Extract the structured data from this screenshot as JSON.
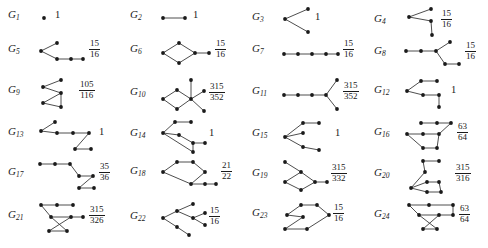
{
  "figure": {
    "type": "graph-catalog",
    "columns": 4,
    "rows": 6,
    "count": 24,
    "node_color": "#1a1a1a",
    "edge_color": "#3a3a3a"
  },
  "graphs": [
    {
      "id": "G1",
      "label": "G",
      "index": "1",
      "value": "1",
      "value_kind": "integer",
      "numerator": "1",
      "denominator": "",
      "width": 14,
      "height": 26,
      "nodes": [
        [
          7,
          13
        ]
      ],
      "edges": []
    },
    {
      "id": "G2",
      "label": "G",
      "index": "2",
      "value": "1",
      "value_kind": "integer",
      "numerator": "1",
      "denominator": "",
      "width": 30,
      "height": 26,
      "nodes": [
        [
          4,
          13
        ],
        [
          26,
          13
        ]
      ],
      "edges": [
        [
          0,
          1
        ]
      ]
    },
    {
      "id": "G3",
      "label": "G",
      "index": "3",
      "value": "1",
      "value_kind": "integer",
      "numerator": "1",
      "denominator": "",
      "width": 30,
      "height": 30,
      "nodes": [
        [
          27,
          4
        ],
        [
          4,
          14
        ],
        [
          27,
          27
        ]
      ],
      "edges": [
        [
          0,
          1
        ],
        [
          1,
          2
        ]
      ]
    },
    {
      "id": "G4",
      "label": "G",
      "index": "4",
      "value_kind": "fraction",
      "numerator": "15",
      "denominator": "16",
      "width": 34,
      "height": 34,
      "nodes": [
        [
          28,
          4
        ],
        [
          6,
          12
        ],
        [
          28,
          16
        ],
        [
          29,
          30
        ]
      ],
      "edges": [
        [
          0,
          1
        ],
        [
          1,
          2
        ],
        [
          2,
          3
        ]
      ]
    },
    {
      "id": "G5",
      "label": "G",
      "index": "5",
      "value_kind": "fraction",
      "numerator": "15",
      "denominator": "16",
      "width": 48,
      "height": 26,
      "nodes": [
        [
          20,
          4
        ],
        [
          4,
          12
        ],
        [
          20,
          20
        ],
        [
          34,
          20
        ],
        [
          46,
          20
        ]
      ],
      "edges": [
        [
          0,
          1
        ],
        [
          1,
          2
        ],
        [
          2,
          3
        ],
        [
          3,
          4
        ]
      ]
    },
    {
      "id": "G6",
      "label": "G",
      "index": "6",
      "value_kind": "fraction",
      "numerator": "15",
      "denominator": "16",
      "width": 52,
      "height": 26,
      "nodes": [
        [
          20,
          4
        ],
        [
          4,
          14
        ],
        [
          20,
          24
        ],
        [
          36,
          14
        ],
        [
          50,
          14
        ]
      ],
      "edges": [
        [
          0,
          1
        ],
        [
          1,
          2
        ],
        [
          2,
          3
        ],
        [
          3,
          0
        ],
        [
          3,
          4
        ]
      ]
    },
    {
      "id": "G7",
      "label": "G",
      "index": "7",
      "value_kind": "fraction",
      "numerator": "15",
      "denominator": "16",
      "width": 58,
      "height": 22,
      "nodes": [
        [
          3,
          13
        ],
        [
          17,
          13
        ],
        [
          31,
          13
        ],
        [
          45,
          13
        ],
        [
          57,
          13
        ]
      ],
      "edges": [
        [
          0,
          1
        ],
        [
          1,
          2
        ],
        [
          2,
          3
        ],
        [
          3,
          4
        ]
      ]
    },
    {
      "id": "G8",
      "label": "G",
      "index": "8",
      "value_kind": "fraction",
      "numerator": "15",
      "denominator": "16",
      "width": 58,
      "height": 30,
      "nodes": [
        [
          3,
          12
        ],
        [
          18,
          12
        ],
        [
          33,
          12
        ],
        [
          47,
          3
        ],
        [
          42,
          25
        ],
        [
          56,
          25
        ]
      ],
      "edges": [
        [
          0,
          1
        ],
        [
          1,
          2
        ],
        [
          2,
          3
        ],
        [
          2,
          4
        ],
        [
          4,
          5
        ]
      ]
    },
    {
      "id": "G9",
      "label": "G",
      "index": "9",
      "value_kind": "fraction",
      "numerator": "105",
      "denominator": "116",
      "width": 38,
      "height": 32,
      "nodes": [
        [
          24,
          3
        ],
        [
          6,
          10
        ],
        [
          24,
          16
        ],
        [
          6,
          26
        ],
        [
          24,
          30
        ]
      ],
      "edges": [
        [
          0,
          1
        ],
        [
          1,
          2
        ],
        [
          2,
          3
        ],
        [
          2,
          4
        ],
        [
          3,
          4
        ]
      ]
    },
    {
      "id": "G10",
      "label": "G",
      "index": "10",
      "value_kind": "fraction",
      "numerator": "315",
      "denominator": "352",
      "width": 46,
      "height": 36,
      "nodes": [
        [
          32,
          3
        ],
        [
          18,
          13
        ],
        [
          4,
          22
        ],
        [
          18,
          32
        ],
        [
          32,
          22
        ],
        [
          45,
          14
        ],
        [
          45,
          34
        ]
      ],
      "edges": [
        [
          1,
          2
        ],
        [
          2,
          3
        ],
        [
          3,
          4
        ],
        [
          4,
          1
        ],
        [
          4,
          0
        ],
        [
          4,
          5
        ],
        [
          4,
          6
        ]
      ]
    },
    {
      "id": "G11",
      "label": "G",
      "index": "11",
      "value_kind": "fraction",
      "numerator": "315",
      "denominator": "352",
      "width": 58,
      "height": 34,
      "nodes": [
        [
          3,
          18
        ],
        [
          17,
          18
        ],
        [
          31,
          18
        ],
        [
          45,
          18
        ],
        [
          56,
          3
        ],
        [
          56,
          32
        ]
      ],
      "edges": [
        [
          0,
          1
        ],
        [
          1,
          2
        ],
        [
          2,
          3
        ],
        [
          3,
          4
        ],
        [
          3,
          5
        ]
      ]
    },
    {
      "id": "G12",
      "label": "G",
      "index": "12",
      "value": "1",
      "value_kind": "integer",
      "numerator": "1",
      "denominator": "",
      "width": 44,
      "height": 32,
      "nodes": [
        [
          18,
          4
        ],
        [
          34,
          4
        ],
        [
          4,
          14
        ],
        [
          20,
          18
        ],
        [
          36,
          18
        ],
        [
          36,
          30
        ]
      ],
      "edges": [
        [
          0,
          1
        ],
        [
          0,
          2
        ],
        [
          2,
          3
        ],
        [
          3,
          4
        ],
        [
          4,
          5
        ]
      ]
    },
    {
      "id": "G13",
      "label": "G",
      "index": "13",
      "value": "1",
      "value_kind": "integer",
      "numerator": "1",
      "denominator": "",
      "width": 58,
      "height": 32,
      "nodes": [
        [
          18,
          3
        ],
        [
          4,
          12
        ],
        [
          20,
          14
        ],
        [
          36,
          14
        ],
        [
          52,
          14
        ],
        [
          38,
          30
        ],
        [
          54,
          30
        ]
      ],
      "edges": [
        [
          0,
          1
        ],
        [
          1,
          2
        ],
        [
          2,
          3
        ],
        [
          3,
          4
        ],
        [
          4,
          5
        ],
        [
          5,
          6
        ]
      ]
    },
    {
      "id": "G14",
      "label": "G",
      "index": "14",
      "value": "1",
      "value_kind": "integer",
      "numerator": "1",
      "denominator": "",
      "width": 46,
      "height": 34,
      "nodes": [
        [
          16,
          3
        ],
        [
          32,
          3
        ],
        [
          4,
          14
        ],
        [
          20,
          16
        ],
        [
          34,
          24
        ],
        [
          46,
          24
        ],
        [
          34,
          33
        ]
      ],
      "edges": [
        [
          0,
          1
        ],
        [
          0,
          2
        ],
        [
          2,
          3
        ],
        [
          3,
          4
        ],
        [
          4,
          5
        ],
        [
          2,
          6
        ],
        [
          4,
          6
        ]
      ]
    },
    {
      "id": "G15",
      "label": "G",
      "index": "15",
      "value": "1",
      "value_kind": "integer",
      "numerator": "1",
      "denominator": "",
      "width": 50,
      "height": 34,
      "nodes": [
        [
          22,
          4
        ],
        [
          38,
          4
        ],
        [
          4,
          18
        ],
        [
          22,
          14
        ],
        [
          22,
          28
        ],
        [
          38,
          31
        ]
      ],
      "edges": [
        [
          0,
          1
        ],
        [
          0,
          2
        ],
        [
          2,
          3
        ],
        [
          2,
          4
        ],
        [
          4,
          5
        ]
      ]
    },
    {
      "id": "G16",
      "label": "G",
      "index": "16",
      "value_kind": "fraction",
      "numerator": "63",
      "denominator": "64",
      "width": 50,
      "height": 32,
      "nodes": [
        [
          18,
          4
        ],
        [
          34,
          4
        ],
        [
          48,
          4
        ],
        [
          4,
          15
        ],
        [
          20,
          15
        ],
        [
          36,
          15
        ],
        [
          20,
          29
        ],
        [
          34,
          29
        ]
      ],
      "edges": [
        [
          0,
          1
        ],
        [
          1,
          2
        ],
        [
          3,
          4
        ],
        [
          4,
          5
        ],
        [
          5,
          2
        ],
        [
          3,
          6
        ],
        [
          6,
          7
        ],
        [
          5,
          7
        ]
      ]
    },
    {
      "id": "G17",
      "label": "G",
      "index": "17",
      "value_kind": "fraction",
      "numerator": "35",
      "denominator": "36",
      "width": 58,
      "height": 34,
      "nodes": [
        [
          3,
          6
        ],
        [
          18,
          6
        ],
        [
          33,
          6
        ],
        [
          42,
          18
        ],
        [
          56,
          18
        ],
        [
          42,
          30
        ],
        [
          57,
          30
        ]
      ],
      "edges": [
        [
          0,
          1
        ],
        [
          1,
          2
        ],
        [
          2,
          3
        ],
        [
          3,
          4
        ],
        [
          4,
          5
        ],
        [
          5,
          6
        ]
      ]
    },
    {
      "id": "G18",
      "label": "G",
      "index": "18",
      "value_kind": "fraction",
      "numerator": "21",
      "denominator": "22",
      "width": 58,
      "height": 32,
      "nodes": [
        [
          18,
          4
        ],
        [
          34,
          4
        ],
        [
          4,
          14
        ],
        [
          46,
          14
        ],
        [
          32,
          26
        ],
        [
          46,
          26
        ],
        [
          57,
          26
        ]
      ],
      "edges": [
        [
          0,
          1
        ],
        [
          0,
          2
        ],
        [
          1,
          3
        ],
        [
          2,
          4
        ],
        [
          3,
          4
        ],
        [
          4,
          5
        ],
        [
          5,
          6
        ]
      ]
    },
    {
      "id": "G19",
      "label": "G",
      "index": "19",
      "value_kind": "fraction",
      "numerator": "315",
      "denominator": "332",
      "width": 46,
      "height": 36,
      "nodes": [
        [
          4,
          4
        ],
        [
          20,
          14
        ],
        [
          4,
          24
        ],
        [
          20,
          32
        ],
        [
          34,
          24
        ],
        [
          46,
          24
        ]
      ],
      "edges": [
        [
          0,
          1
        ],
        [
          1,
          2
        ],
        [
          2,
          3
        ],
        [
          3,
          4
        ],
        [
          1,
          4
        ],
        [
          4,
          5
        ]
      ]
    },
    {
      "id": "G20",
      "label": "G",
      "index": "20",
      "value_kind": "fraction",
      "numerator": "315",
      "denominator": "316",
      "width": 48,
      "height": 36,
      "nodes": [
        [
          20,
          3
        ],
        [
          36,
          3
        ],
        [
          22,
          14
        ],
        [
          8,
          30
        ],
        [
          24,
          24
        ],
        [
          24,
          34
        ],
        [
          38,
          34
        ],
        [
          36,
          24
        ]
      ],
      "edges": [
        [
          0,
          1
        ],
        [
          0,
          2
        ],
        [
          2,
          3
        ],
        [
          3,
          4
        ],
        [
          4,
          7
        ],
        [
          3,
          5
        ],
        [
          5,
          6
        ],
        [
          7,
          6
        ]
      ]
    },
    {
      "id": "G21",
      "label": "G",
      "index": "21",
      "value_kind": "fraction",
      "numerator": "315",
      "denominator": "326",
      "width": 48,
      "height": 34,
      "nodes": [
        [
          4,
          4
        ],
        [
          20,
          4
        ],
        [
          36,
          4
        ],
        [
          14,
          16
        ],
        [
          34,
          16
        ],
        [
          46,
          16
        ],
        [
          12,
          30
        ],
        [
          30,
          30
        ]
      ],
      "edges": [
        [
          0,
          1
        ],
        [
          1,
          2
        ],
        [
          0,
          3
        ],
        [
          3,
          4
        ],
        [
          4,
          5
        ],
        [
          3,
          7
        ],
        [
          6,
          7
        ],
        [
          6,
          4
        ]
      ]
    },
    {
      "id": "G22",
      "label": "G",
      "index": "22",
      "value_kind": "fraction",
      "numerator": "15",
      "denominator": "16",
      "width": 46,
      "height": 36,
      "nodes": [
        [
          34,
          3
        ],
        [
          18,
          10
        ],
        [
          4,
          17
        ],
        [
          34,
          17
        ],
        [
          46,
          12
        ],
        [
          46,
          24
        ],
        [
          18,
          26
        ],
        [
          30,
          34
        ]
      ],
      "edges": [
        [
          0,
          1
        ],
        [
          1,
          2
        ],
        [
          2,
          6
        ],
        [
          6,
          7
        ],
        [
          1,
          3
        ],
        [
          3,
          4
        ],
        [
          3,
          5
        ]
      ]
    },
    {
      "id": "G23",
      "label": "G",
      "index": "23",
      "value_kind": "fraction",
      "numerator": "15",
      "denominator": "16",
      "width": 48,
      "height": 30,
      "nodes": [
        [
          20,
          4
        ],
        [
          36,
          4
        ],
        [
          6,
          14
        ],
        [
          22,
          16
        ],
        [
          48,
          14
        ],
        [
          4,
          28
        ],
        [
          26,
          28
        ]
      ],
      "edges": [
        [
          0,
          1
        ],
        [
          0,
          2
        ],
        [
          1,
          4
        ],
        [
          2,
          3
        ],
        [
          3,
          5
        ],
        [
          5,
          6
        ],
        [
          6,
          4
        ]
      ]
    },
    {
      "id": "G24",
      "label": "G",
      "index": "24",
      "value_kind": "fraction",
      "numerator": "63",
      "denominator": "64",
      "width": 52,
      "height": 32,
      "nodes": [
        [
          6,
          4
        ],
        [
          26,
          4
        ],
        [
          50,
          4
        ],
        [
          16,
          14
        ],
        [
          36,
          14
        ],
        [
          50,
          14
        ],
        [
          20,
          28
        ],
        [
          34,
          28
        ]
      ],
      "edges": [
        [
          0,
          1
        ],
        [
          1,
          2
        ],
        [
          0,
          3
        ],
        [
          3,
          4
        ],
        [
          4,
          5
        ],
        [
          2,
          5
        ],
        [
          3,
          7
        ],
        [
          6,
          7
        ],
        [
          6,
          4
        ]
      ]
    }
  ]
}
